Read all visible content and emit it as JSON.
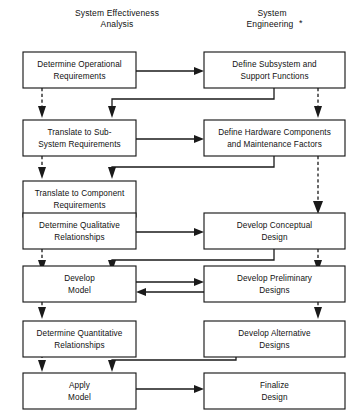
{
  "diagram": {
    "columns": [
      {
        "id": "left",
        "line1": "System Effectiveness",
        "line2": "Analysis",
        "asterisk": ""
      },
      {
        "id": "right",
        "line1": "System",
        "line2": "Engineering",
        "asterisk": "*"
      }
    ],
    "nodes": [
      {
        "id": "n1",
        "col": "left",
        "row": 1,
        "line1": "Determine Operational",
        "line2": "Requirements"
      },
      {
        "id": "n2",
        "col": "right",
        "row": 1,
        "line1": "Define Subsystem and",
        "line2": "Support Functions"
      },
      {
        "id": "n3",
        "col": "left",
        "row": 2,
        "line1": "Translate to Sub-",
        "line2": "System  Requirements"
      },
      {
        "id": "n4",
        "col": "right",
        "row": 2,
        "line1": "Define Hardware Components",
        "line2": "and Maintenance Factors"
      },
      {
        "id": "n5",
        "col": "left",
        "row": 3,
        "line1": "Translate to Component",
        "line2": "Requirements"
      },
      {
        "id": "n6",
        "col": "left",
        "row": 4,
        "line1": "Determine Qualitative",
        "line2": "Relationships"
      },
      {
        "id": "n7",
        "col": "right",
        "row": 4,
        "line1": "Develop Conceptual",
        "line2": "Design"
      },
      {
        "id": "n8",
        "col": "left",
        "row": 5,
        "line1": "Develop",
        "line2": "Model"
      },
      {
        "id": "n9",
        "col": "right",
        "row": 5,
        "line1": "Develop Preliminary",
        "line2": "Designs"
      },
      {
        "id": "n10",
        "col": "left",
        "row": 6,
        "line1": "Determine Quantitative",
        "line2": "Relationships"
      },
      {
        "id": "n11",
        "col": "right",
        "row": 6,
        "line1": "Develop Alternative",
        "line2": "Designs"
      },
      {
        "id": "n12",
        "col": "left",
        "row": 7,
        "line1": "Apply",
        "line2": "Model"
      },
      {
        "id": "n13",
        "col": "right",
        "row": 7,
        "line1": "Finalize",
        "line2": "Design"
      }
    ],
    "connectors": [
      {
        "id": "c1",
        "from": "n1",
        "to": "n2",
        "style": "solid",
        "kind": "across-right"
      },
      {
        "id": "c2",
        "from": "n2",
        "to": "n3",
        "style": "solid",
        "kind": "feedback-left-down"
      },
      {
        "id": "c3",
        "from": "n1",
        "to": "n3",
        "style": "dashed",
        "kind": "down"
      },
      {
        "id": "c4",
        "from": "n2",
        "to": "n4",
        "style": "dashed",
        "kind": "down"
      },
      {
        "id": "c5",
        "from": "n3",
        "to": "n4",
        "style": "solid",
        "kind": "across-right"
      },
      {
        "id": "c6",
        "from": "n4",
        "to": "n5",
        "style": "solid",
        "kind": "feedback-left-down"
      },
      {
        "id": "c7",
        "from": "n3",
        "to": "n5",
        "style": "dashed",
        "kind": "down"
      },
      {
        "id": "c8",
        "from": "n4",
        "to": "n7",
        "style": "dashed",
        "kind": "down-long"
      },
      {
        "id": "c9",
        "from": "n5",
        "to": "n6",
        "style": "dashed",
        "kind": "down"
      },
      {
        "id": "c10",
        "from": "n6",
        "to": "n7",
        "style": "solid",
        "kind": "across-right"
      },
      {
        "id": "c11",
        "from": "n7",
        "to": "n8",
        "style": "solid",
        "kind": "feedback-left-down"
      },
      {
        "id": "c12",
        "from": "n6",
        "to": "n8",
        "style": "dashed",
        "kind": "down"
      },
      {
        "id": "c13",
        "from": "n7",
        "to": "n9",
        "style": "dashed",
        "kind": "down"
      },
      {
        "id": "c14",
        "from": "n8",
        "to": "n9",
        "style": "solid",
        "kind": "across-right"
      },
      {
        "id": "c15",
        "from": "n9",
        "to": "n8",
        "style": "solid",
        "kind": "across-left"
      },
      {
        "id": "c16",
        "from": "n8",
        "to": "n10",
        "style": "dashed",
        "kind": "down"
      },
      {
        "id": "c17",
        "from": "n9",
        "to": "n11",
        "style": "dashed",
        "kind": "down"
      },
      {
        "id": "c18",
        "from": "n11",
        "to": "n12",
        "style": "solid",
        "kind": "feedback-left-down"
      },
      {
        "id": "c19",
        "from": "n10",
        "to": "n12",
        "style": "dashed",
        "kind": "down"
      },
      {
        "id": "c20",
        "from": "n12",
        "to": "n13",
        "style": "solid",
        "kind": "across-right"
      }
    ],
    "colors": {
      "line": "#1a1a1a",
      "box_fill": "#ffffff",
      "text": "#111111",
      "background": "#ffffff"
    }
  }
}
